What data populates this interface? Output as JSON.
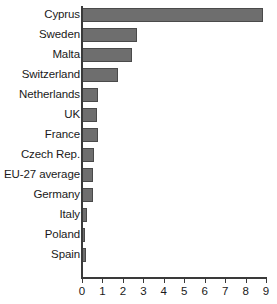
{
  "chart_data": {
    "type": "bar",
    "orientation": "horizontal",
    "title": "",
    "subtitle": "",
    "xlabel": "",
    "ylabel": "",
    "xlim": [
      0,
      9
    ],
    "grid": false,
    "legend": null,
    "bar_color": "#6e6e6e",
    "bar_edge_color": "#4a4a4a",
    "axis_color": "#3a3a3a",
    "xticks": [
      0,
      1,
      2,
      3,
      4,
      5,
      6,
      7,
      8,
      9
    ],
    "xtick_labels": [
      "0",
      "1",
      "2",
      "3",
      "4",
      "5",
      "6",
      "7",
      "8",
      "9"
    ],
    "categories": [
      "Cyprus",
      "Sweden",
      "Malta",
      "Switzerland",
      "Netherlands",
      "UK",
      "France",
      "Czech Rep.",
      "EU-27 average",
      "Germany",
      "Italy",
      "Poland",
      "Spain"
    ],
    "values": [
      8.85,
      2.7,
      2.45,
      1.75,
      0.8,
      0.75,
      0.78,
      0.6,
      0.55,
      0.52,
      0.25,
      0.15,
      0.18
    ]
  }
}
